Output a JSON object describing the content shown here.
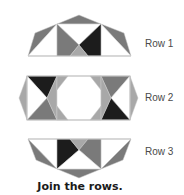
{
  "rows": [
    {
      "id": "row1",
      "label": "Row 1"
    },
    {
      "id": "row2",
      "label": "Row 2"
    },
    {
      "id": "row3",
      "label": "Row 3"
    }
  ],
  "caption": "Join the rows.",
  "colors": {
    "white": "#ffffff",
    "light": "#a8a8a8",
    "medium": "#7a7a7a",
    "dark": "#1c1c1c",
    "outline": "#bdbdbd"
  }
}
